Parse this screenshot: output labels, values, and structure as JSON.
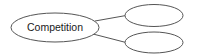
{
  "diagram": {
    "type": "concept-map",
    "central_node": {
      "label": "Competition"
    },
    "child_nodes": [
      {
        "label": ""
      },
      {
        "label": ""
      }
    ],
    "stroke_color": "#555555",
    "background": "#ffffff"
  }
}
